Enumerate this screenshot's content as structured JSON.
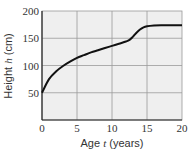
{
  "chart_data": {
    "type": "line",
    "title": "",
    "xlabel": "Age t (years)",
    "ylabel": "Height h (cm)",
    "xlim": [
      0,
      20
    ],
    "ylim": [
      0,
      200
    ],
    "xticks": [
      0,
      5,
      10,
      15,
      20
    ],
    "yticks": [
      50,
      100,
      150,
      200
    ],
    "grid": true,
    "legend": null,
    "series": [
      {
        "name": "height",
        "x": [
          0,
          1,
          2,
          3,
          4,
          5,
          6,
          7,
          8,
          9,
          10,
          11,
          12,
          12.5,
          13,
          13.5,
          14,
          14.5,
          15,
          16,
          17,
          18,
          19,
          20
        ],
        "y": [
          50,
          75,
          89,
          99,
          107,
          114,
          119,
          124,
          128,
          132,
          136,
          140,
          144,
          147,
          153,
          160,
          166,
          170,
          172,
          173.5,
          174,
          174,
          174,
          174
        ]
      }
    ]
  },
  "labels": {
    "xlabel_prefix": "Age ",
    "xlabel_var": "t",
    "xlabel_suffix": " (years)",
    "ylabel_prefix": "Height ",
    "ylabel_var": "h",
    "ylabel_suffix": " (cm)"
  },
  "colors": {
    "plot_bg": "#efefef",
    "grid": "#9a9a9a",
    "line": "#111111",
    "axis": "#222222"
  }
}
